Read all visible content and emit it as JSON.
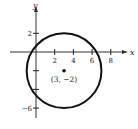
{
  "chart_data": {
    "type": "scatter",
    "title": "",
    "xlabel": "x",
    "ylabel": "y",
    "xlim": [
      -4,
      10
    ],
    "ylim": [
      -8,
      5.5
    ],
    "grid": false,
    "x_ticks": [
      2,
      4,
      6,
      8
    ],
    "x_tick_labels": [
      "2",
      "4",
      "6",
      "8"
    ],
    "y_ticks": [
      2,
      -2,
      -4,
      -6
    ],
    "y_tick_labels": [
      "2",
      "",
      "",
      "−6"
    ],
    "circle": {
      "center": [
        3,
        -2
      ],
      "radius": 4
    },
    "points": [
      {
        "x": 3,
        "y": -2,
        "label": "(3, −2)"
      }
    ]
  }
}
